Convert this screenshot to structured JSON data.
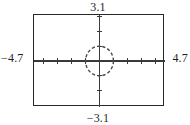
{
  "figure": {
    "kind": "graphing-calculator-viewing-window",
    "bounds": {
      "ymax_label": "3.1",
      "ymin_label": "−3.1",
      "xmin_label": "−4.7",
      "xmax_label": "4.7"
    },
    "colors": {
      "frame": "#272727",
      "axis": "#3a3a3a",
      "curve": "#4a4a4a",
      "text": "#1f1f1f",
      "background": "#ffffff"
    }
  },
  "chart_data": {
    "type": "line",
    "title": "",
    "xlabel": "",
    "ylabel": "",
    "xlim": [
      -4.7,
      4.7
    ],
    "ylim": [
      -3.1,
      3.1
    ],
    "grid": false,
    "legend": "none",
    "xtick_step": 1,
    "ytick_step": 1,
    "xticks": [
      -4,
      -3,
      -2,
      -1,
      0,
      1,
      2,
      3,
      4
    ],
    "yticks": [
      -3,
      -2,
      -1,
      0,
      1,
      2,
      3
    ],
    "tick_style": "axis-hash-marks",
    "axes": {
      "x_axis_y": 0,
      "y_axis_x": 0,
      "drawn": true
    },
    "series": [
      {
        "name": "unit circle",
        "kind": "implicit-circle",
        "center": [
          0,
          0
        ],
        "radius": 1,
        "linestyle": "dashed",
        "equation": "x^2 + y^2 = 1"
      }
    ]
  }
}
